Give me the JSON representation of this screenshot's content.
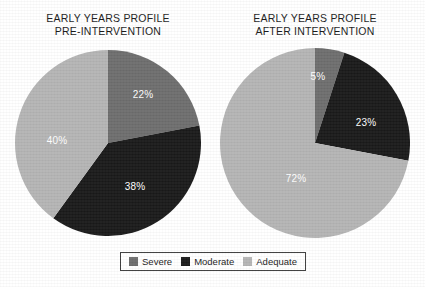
{
  "figure": {
    "background_color": "#ffffff",
    "label_color": "#ffffff"
  },
  "legend": {
    "entries": [
      {
        "label": "Severe",
        "color": "#6e6e6e"
      },
      {
        "label": "Moderate",
        "color": "#1a1a1a"
      },
      {
        "label": "Adequate",
        "color": "#b5b5b5"
      }
    ]
  },
  "chart_data": [
    {
      "type": "pie",
      "title": "EARLY YEARS PROFILE PRE-INTERVENTION",
      "title_lines": [
        "EARLY YEARS PROFILE",
        "PRE-INTERVENTION"
      ],
      "categories": [
        "Severe",
        "Moderate",
        "Adequate"
      ],
      "values": [
        22,
        38,
        40
      ],
      "value_labels": [
        "22%",
        "38%",
        "40%"
      ],
      "colors": [
        "#6e6e6e",
        "#1a1a1a",
        "#b5b5b5"
      ],
      "start_angle_deg": 0,
      "direction": "clockwise",
      "units": "percent",
      "legend_position": "bottom-center",
      "grid": false
    },
    {
      "type": "pie",
      "title": "EARLY YEARS PROFILE AFTER INTERVENTION",
      "title_lines": [
        "EARLY YEARS PROFILE",
        "AFTER INTERVENTION"
      ],
      "categories": [
        "Severe",
        "Moderate",
        "Adequate"
      ],
      "values": [
        5,
        23,
        72
      ],
      "value_labels": [
        "5%",
        "23%",
        "72%"
      ],
      "colors": [
        "#6e6e6e",
        "#1a1a1a",
        "#b5b5b5"
      ],
      "start_angle_deg": 0,
      "direction": "clockwise",
      "units": "percent",
      "legend_position": "bottom-center",
      "grid": false
    }
  ],
  "layout": {
    "pies": [
      {
        "cx": 108,
        "cy": 143,
        "r": 93
      },
      {
        "cx": 315,
        "cy": 143,
        "r": 95
      }
    ],
    "titles": [
      {
        "left": 18,
        "top": 12,
        "width": 180
      },
      {
        "left": 222,
        "top": 12,
        "width": 186
      }
    ],
    "label_positions": [
      [
        {
          "x": 143,
          "y": 94
        },
        {
          "x": 135,
          "y": 186
        },
        {
          "x": 57,
          "y": 140
        }
      ],
      [
        {
          "x": 318,
          "y": 76
        },
        {
          "x": 366,
          "y": 122
        },
        {
          "x": 296,
          "y": 178
        }
      ]
    ]
  }
}
